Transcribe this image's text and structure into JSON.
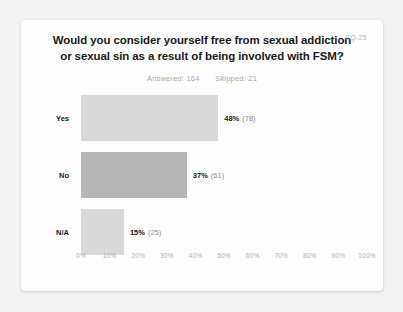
{
  "card": {
    "title": "Would you consider yourself free from sexual addiction or sexual sin as a result of being involved with FSM?",
    "question_code": "SQ-25",
    "answered_label": "Answered: 164",
    "skipped_label": "Skipped: 21"
  },
  "chart_data": {
    "type": "bar",
    "orientation": "horizontal",
    "title": "Would you consider yourself free from sexual addiction or sexual sin as a result of being involved with FSM?",
    "xlabel": "",
    "ylabel": "",
    "xlim": [
      0,
      100
    ],
    "grid": false,
    "legend": "none",
    "categories": [
      "Yes",
      "No",
      "N/A"
    ],
    "values": [
      48,
      37,
      15
    ],
    "counts": [
      78,
      61,
      25
    ],
    "value_labels": [
      "48%",
      "37%",
      "15%"
    ],
    "count_labels": [
      "(78)",
      "(61)",
      "(25)"
    ],
    "colors": [
      "#d9d9d9",
      "#b6b6b6",
      "#d9d9d9"
    ],
    "answered": 164,
    "skipped": 21,
    "xticks": [
      0,
      10,
      20,
      30,
      40,
      50,
      60,
      70,
      80,
      90,
      100
    ],
    "xticklabels": [
      "0%",
      "10%",
      "20%",
      "30%",
      "40%",
      "50%",
      "60%",
      "70%",
      "80%",
      "90%",
      "100%"
    ]
  }
}
